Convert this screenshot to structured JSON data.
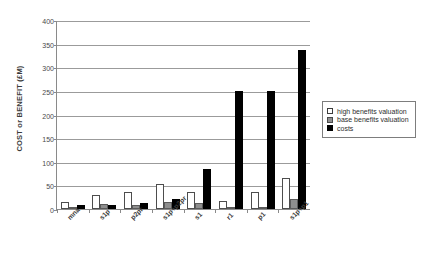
{
  "chart_data": {
    "type": "bar",
    "title": "",
    "xlabel": "",
    "ylabel": "COST or BENEFIT (£M)",
    "ylim": [
      0,
      400
    ],
    "yticks": [
      0,
      50,
      100,
      150,
      200,
      250,
      300,
      350,
      400
    ],
    "grid": true,
    "legend_position": "right",
    "categories": [
      "mna",
      "s1p",
      "p2pr",
      "s1p+p2pr",
      "s1",
      "r1",
      "p1",
      "s1p+p1"
    ],
    "series": [
      {
        "name": "high benefits valuation",
        "color": "#ffffff",
        "values": [
          14,
          30,
          35,
          52,
          37,
          17,
          37,
          65
        ]
      },
      {
        "name": "base benefits valuation",
        "color": "#8e8e8e",
        "values": [
          2,
          11,
          9,
          15,
          13,
          4,
          5,
          22
        ]
      },
      {
        "name": "costs",
        "color": "#000000",
        "values": [
          8,
          8,
          13,
          22,
          85,
          250,
          250,
          337
        ]
      }
    ]
  },
  "legend": {
    "items": [
      {
        "label": "high benefits valuation",
        "swatch": "high"
      },
      {
        "label": "base benefits valuation",
        "swatch": "base"
      },
      {
        "label": "costs",
        "swatch": "cost"
      }
    ]
  }
}
